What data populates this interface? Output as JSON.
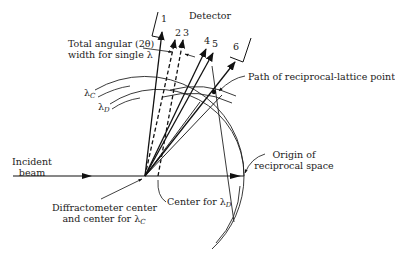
{
  "labels": {
    "detector": "Detector",
    "angular_width_line1": "Total angular (2θ)",
    "angular_width_line2": "width for single λ",
    "lambda_c": "λ",
    "lambda_c_sub": "C",
    "lambda_d": "λ",
    "lambda_d_sub": "D",
    "path_point": "Path of reciprocal-lattice point",
    "incident_line1": "Incident",
    "incident_line2": "beam",
    "origin_line1": "Origin of",
    "origin_line2": "reciprocal space",
    "center_d": "Center for λ",
    "center_d_sub": "D",
    "diff_center_line1": "Diffractometer center",
    "diff_center_line2": "and center for λ",
    "diff_center_sub": "C"
  },
  "rays": [
    {
      "id": "1",
      "label": "1"
    },
    {
      "id": "2",
      "label": "2"
    },
    {
      "id": "3",
      "label": "3"
    },
    {
      "id": "4",
      "label": "4"
    },
    {
      "id": "5",
      "label": "5"
    },
    {
      "id": "6",
      "label": "6"
    }
  ]
}
